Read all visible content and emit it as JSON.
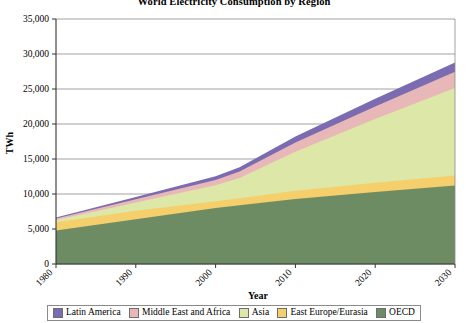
{
  "chart_data": {
    "type": "area",
    "stacked": true,
    "title": "World Electricity Consumption by Region",
    "xlabel": "Year",
    "ylabel": "TWh",
    "xlim": [
      1980,
      2030
    ],
    "ylim": [
      0,
      35000
    ],
    "xticks": [
      "1980",
      "1990",
      "2000",
      "2010",
      "2020",
      "2030"
    ],
    "xtick_values": [
      1980,
      1990,
      2000,
      2010,
      2020,
      2030
    ],
    "yticks": [
      "0",
      "5,000",
      "10,000",
      "15,000",
      "20,000",
      "25,000",
      "30,000",
      "35,000"
    ],
    "ytick_values": [
      0,
      5000,
      10000,
      15000,
      20000,
      25000,
      30000,
      35000
    ],
    "grid": true,
    "legend_position": "bottom",
    "x": [
      1980,
      1990,
      2000,
      2003,
      2010,
      2020,
      2030
    ],
    "series": [
      {
        "name": "OECD",
        "color": "#6e8c63",
        "values": [
          4800,
          6400,
          8000,
          8400,
          9300,
          10300,
          11200
        ]
      },
      {
        "name": "East Europe/Eurasia",
        "color": "#f5cf6b",
        "values": [
          1150,
          1200,
          950,
          1000,
          1150,
          1300,
          1450
        ]
      },
      {
        "name": "Asia",
        "color": "#dde8a8",
        "values": [
          350,
          1200,
          2300,
          2900,
          5600,
          9100,
          12500
        ]
      },
      {
        "name": "Middle East and Africa",
        "color": "#e8b8b8",
        "values": [
          200,
          450,
          750,
          900,
          1300,
          1800,
          2300
        ]
      },
      {
        "name": "Latin America",
        "color": "#7b6bb0",
        "values": [
          150,
          330,
          540,
          620,
          850,
          1100,
          1350
        ]
      }
    ],
    "totals": [
      6650,
      9580,
      12540,
      13820,
      18200,
      23600,
      28800
    ]
  },
  "legend": {
    "items": [
      {
        "label": "Latin America",
        "color": "#7b6bb0"
      },
      {
        "label": "Middle East and Africa",
        "color": "#e8b8b8"
      },
      {
        "label": "Asia",
        "color": "#dde8a8"
      },
      {
        "label": "East Europe/Eurasia",
        "color": "#f5cf6b"
      },
      {
        "label": "OECD",
        "color": "#6e8c63"
      }
    ]
  }
}
